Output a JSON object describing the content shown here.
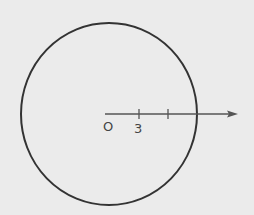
{
  "diagram": {
    "type": "geometry",
    "circle": {
      "cx": 109,
      "cy": 114,
      "rx": 88,
      "ry": 91,
      "stroke": "#333333"
    },
    "ray": {
      "x1": 105,
      "y1": 114,
      "x2": 238,
      "y2": 114,
      "stroke": "#555555"
    },
    "ticks": [
      {
        "x": 139,
        "label": "3"
      },
      {
        "x": 168,
        "label": ""
      }
    ],
    "origin_label": "O",
    "background": "#ebebeb"
  }
}
